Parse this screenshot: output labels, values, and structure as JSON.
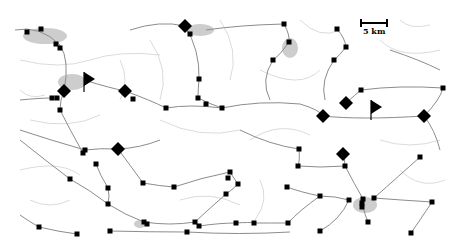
{
  "map": {
    "background": "#ffffff",
    "road_color": "#8a8a8a",
    "minor_road_color": "#c4c4c4",
    "urban_color": "#b0b0b0",
    "scale_bar": {
      "label": "5 km"
    },
    "markers": {
      "diamonds": [
        {
          "x": 185,
          "y": 26
        },
        {
          "x": 64,
          "y": 91
        },
        {
          "x": 125,
          "y": 91
        },
        {
          "x": 346,
          "y": 103
        },
        {
          "x": 323,
          "y": 116
        },
        {
          "x": 424,
          "y": 116
        },
        {
          "x": 118,
          "y": 149
        },
        {
          "x": 343,
          "y": 154
        }
      ],
      "flags": [
        {
          "x": 84,
          "y": 80
        },
        {
          "x": 372,
          "y": 108
        }
      ],
      "squares": [
        {
          "x": 27,
          "y": 32
        },
        {
          "x": 41,
          "y": 29
        },
        {
          "x": 56,
          "y": 44
        },
        {
          "x": 60,
          "y": 48
        },
        {
          "x": 190,
          "y": 34
        },
        {
          "x": 52,
          "y": 98
        },
        {
          "x": 57,
          "y": 98
        },
        {
          "x": 60,
          "y": 110
        },
        {
          "x": 133,
          "y": 99
        },
        {
          "x": 166,
          "y": 108
        },
        {
          "x": 199,
          "y": 79
        },
        {
          "x": 198,
          "y": 98
        },
        {
          "x": 206,
          "y": 104
        },
        {
          "x": 222,
          "y": 108
        },
        {
          "x": 284,
          "y": 24
        },
        {
          "x": 337,
          "y": 29
        },
        {
          "x": 289,
          "y": 42
        },
        {
          "x": 346,
          "y": 47
        },
        {
          "x": 273,
          "y": 60
        },
        {
          "x": 334,
          "y": 60
        },
        {
          "x": 361,
          "y": 90
        },
        {
          "x": 443,
          "y": 88
        },
        {
          "x": 85,
          "y": 150
        },
        {
          "x": 83,
          "y": 153
        },
        {
          "x": 96,
          "y": 164
        },
        {
          "x": 70,
          "y": 179
        },
        {
          "x": 108,
          "y": 188
        },
        {
          "x": 143,
          "y": 183
        },
        {
          "x": 174,
          "y": 187
        },
        {
          "x": 230,
          "y": 172
        },
        {
          "x": 108,
          "y": 204
        },
        {
          "x": 39,
          "y": 227
        },
        {
          "x": 77,
          "y": 234
        },
        {
          "x": 110,
          "y": 231
        },
        {
          "x": 144,
          "y": 222
        },
        {
          "x": 147,
          "y": 224
        },
        {
          "x": 228,
          "y": 178
        },
        {
          "x": 238,
          "y": 184
        },
        {
          "x": 226,
          "y": 194
        },
        {
          "x": 195,
          "y": 222
        },
        {
          "x": 199,
          "y": 226
        },
        {
          "x": 299,
          "y": 149
        },
        {
          "x": 298,
          "y": 166
        },
        {
          "x": 345,
          "y": 166
        },
        {
          "x": 420,
          "y": 157
        },
        {
          "x": 236,
          "y": 223
        },
        {
          "x": 254,
          "y": 223
        },
        {
          "x": 288,
          "y": 223
        },
        {
          "x": 349,
          "y": 200
        },
        {
          "x": 363,
          "y": 199
        },
        {
          "x": 362,
          "y": 203
        },
        {
          "x": 374,
          "y": 198
        },
        {
          "x": 362,
          "y": 207
        },
        {
          "x": 432,
          "y": 202
        },
        {
          "x": 368,
          "y": 222
        },
        {
          "x": 287,
          "y": 187
        },
        {
          "x": 320,
          "y": 196
        },
        {
          "x": 320,
          "y": 231
        },
        {
          "x": 187,
          "y": 232
        },
        {
          "x": 411,
          "y": 233
        }
      ]
    }
  }
}
